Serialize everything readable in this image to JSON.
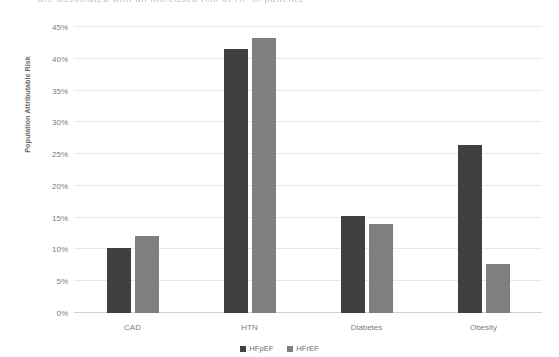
{
  "top_text": "are associated with an increased risk of HF in patients",
  "chart_data": {
    "type": "bar",
    "title": "",
    "xlabel": "",
    "ylabel": "Population Attributable Risk",
    "categories": [
      "CAD",
      "HTN",
      "Diabetes",
      "Obesity"
    ],
    "ylim": [
      0,
      45
    ],
    "ytick_labels": [
      "0%",
      "5%",
      "10%",
      "15%",
      "20%",
      "25%",
      "30%",
      "35%",
      "40%",
      "45%"
    ],
    "ytick_values": [
      0,
      5,
      10,
      15,
      20,
      25,
      30,
      35,
      40,
      45
    ],
    "grid": true,
    "legend_position": "bottom",
    "series": [
      {
        "name": "HFpEF",
        "color": "#404040",
        "values": [
          10.3,
          41.5,
          15.2,
          26.5
        ]
      },
      {
        "name": "HFrEF",
        "color": "#7f7f7f",
        "values": [
          12.1,
          43.3,
          14.0,
          7.7
        ]
      }
    ]
  }
}
